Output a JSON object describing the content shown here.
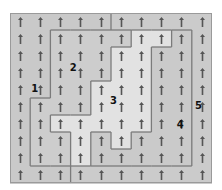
{
  "diagram": {
    "title": "",
    "grid": {
      "rows": 10,
      "cols": 10
    },
    "cell_glyph": "up-arrow-icon",
    "region_map": [
      [
        1,
        1,
        1,
        1,
        1,
        5,
        5,
        5,
        5,
        5
      ],
      [
        1,
        1,
        2,
        2,
        2,
        2,
        3,
        3,
        4,
        5
      ],
      [
        1,
        1,
        2,
        2,
        2,
        3,
        3,
        4,
        4,
        5
      ],
      [
        1,
        1,
        2,
        2,
        2,
        3,
        3,
        4,
        4,
        5
      ],
      [
        1,
        1,
        2,
        2,
        3,
        3,
        3,
        4,
        4,
        5
      ],
      [
        1,
        2,
        2,
        2,
        3,
        3,
        3,
        4,
        4,
        5
      ],
      [
        1,
        2,
        3,
        3,
        3,
        3,
        3,
        4,
        4,
        5
      ],
      [
        1,
        2,
        2,
        3,
        4,
        3,
        4,
        4,
        4,
        5
      ],
      [
        1,
        2,
        2,
        3,
        4,
        4,
        4,
        4,
        4,
        5
      ],
      [
        1,
        1,
        1,
        5,
        5,
        5,
        5,
        5,
        5,
        5
      ]
    ],
    "regions": [
      {
        "id": 1,
        "label": "1",
        "label_cell": [
          4,
          1
        ],
        "color": "#c9c9c9"
      },
      {
        "id": 2,
        "label": "2",
        "label_cell": [
          3,
          3
        ],
        "color": "#cdcdcd"
      },
      {
        "id": 3,
        "label": "3",
        "label_cell": [
          5,
          5
        ],
        "color": "#e2e2e2"
      },
      {
        "id": 4,
        "label": "4",
        "label_cell": [
          6,
          8
        ],
        "color": "#cacaca"
      },
      {
        "id": 5,
        "label": "5",
        "label_cell": [
          5,
          9
        ],
        "color": "#cbcbcb"
      }
    ],
    "colors": {
      "border": "#7b7b7b",
      "arrow": "#555555",
      "outer_border": "#9a9a9a"
    }
  }
}
